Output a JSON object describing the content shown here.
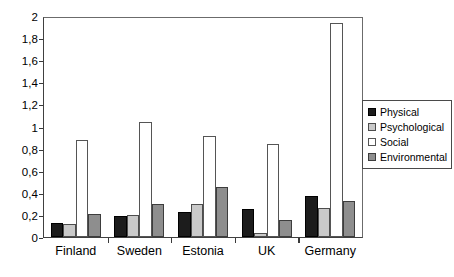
{
  "chart_data": {
    "type": "bar",
    "title": "",
    "subtitle": "",
    "xlabel": "",
    "ylabel": "",
    "grid": false,
    "legend_position": "right",
    "ylim": [
      0,
      2
    ],
    "ytick_labels": [
      "0",
      "0,2",
      "0,4",
      "0,6",
      "0,8",
      "1",
      "1,2",
      "1,4",
      "1,6",
      "1,8",
      "2"
    ],
    "ytick_values": [
      0,
      0.2,
      0.4,
      0.6,
      0.8,
      1,
      1.2,
      1.4,
      1.6,
      1.8,
      2
    ],
    "categories": [
      "Finland",
      "Sweden",
      "Estonia",
      "UK",
      "Germany"
    ],
    "series": [
      {
        "name": "Physical",
        "color": "#1c1c1c",
        "values": [
          0.13,
          0.19,
          0.23,
          0.25,
          0.37
        ]
      },
      {
        "name": "Psychological",
        "color": "#c9c9c9",
        "values": [
          0.12,
          0.2,
          0.3,
          0.04,
          0.26
        ]
      },
      {
        "name": "Social",
        "color": "#ffffff",
        "values": [
          0.88,
          1.04,
          0.91,
          0.84,
          1.94
        ]
      },
      {
        "name": "Environmental",
        "color": "#8e8e8e",
        "values": [
          0.21,
          0.3,
          0.45,
          0.15,
          0.33
        ]
      }
    ]
  },
  "legend": {
    "items": [
      {
        "label": "Physical"
      },
      {
        "label": "Psychological"
      },
      {
        "label": "Social"
      },
      {
        "label": "Environmental"
      }
    ]
  }
}
